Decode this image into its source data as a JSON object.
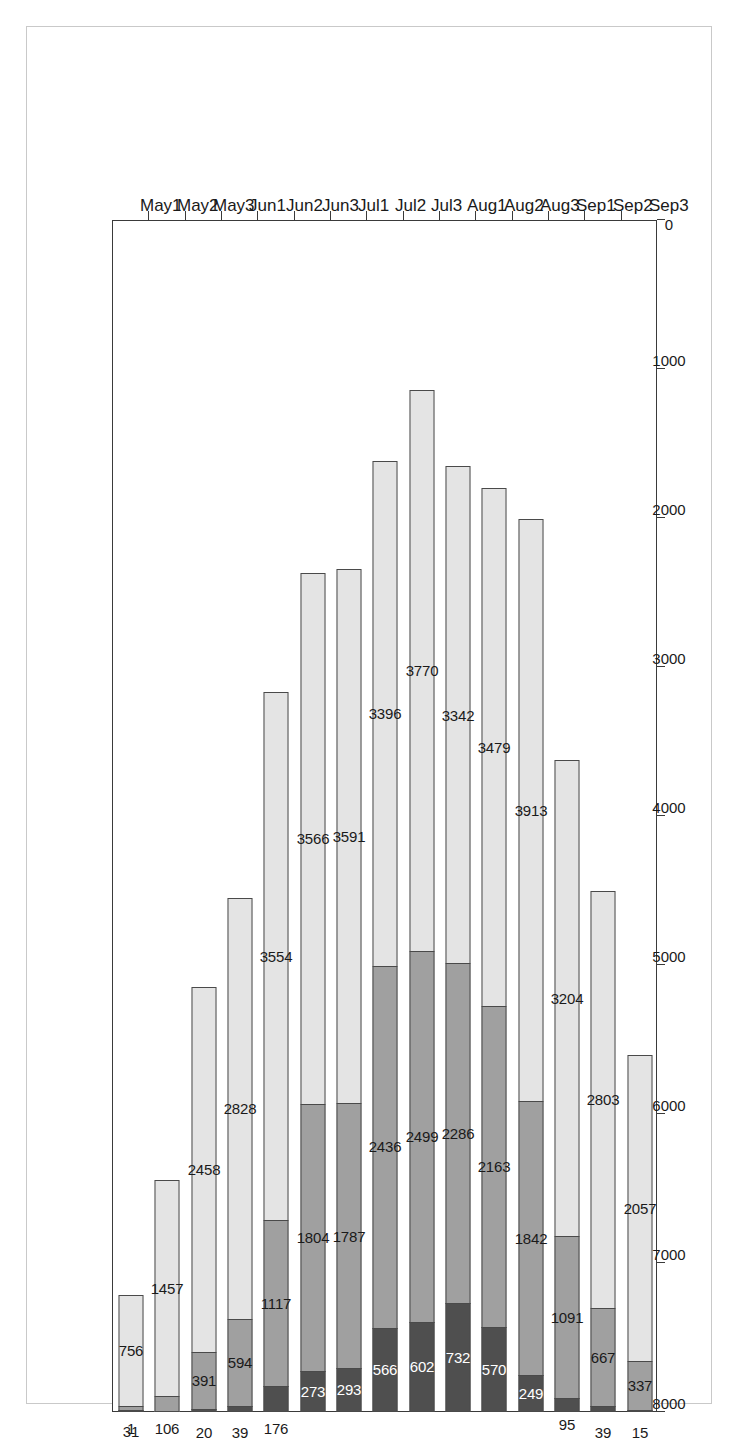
{
  "chart_data": {
    "type": "bar",
    "orientation": "horizontal-stacked",
    "title": "Thessaloniki, Greece",
    "subtitle": "Hours of THI values / category",
    "subtitle2": "Baseline: 1961–90",
    "xlabel": "",
    "ylabel": "",
    "grid": false,
    "legend_position": "top-left",
    "value_axis": {
      "ticks": [
        8000,
        7000,
        6000,
        5000,
        4000,
        3000,
        2000,
        1000,
        0
      ],
      "tick_labels": [
        "8000",
        "7000",
        "6000",
        "5000",
        "4000",
        "3000",
        "2000",
        "1000",
        "0"
      ],
      "min": 0,
      "max": 8000
    },
    "categories": [
      "May1",
      "May2",
      "May3",
      "Jun1",
      "Jun2",
      "Jun3",
      "Jul1",
      "Jul2",
      "Jul3",
      "Aug1",
      "Aug2",
      "Aug3",
      "Sep1",
      "Sep2",
      "Sep3"
    ],
    "series": [
      {
        "name": "84–91",
        "color": "#4f4f4f",
        "values": [
          1,
          0,
          20,
          39,
          176,
          273,
          293,
          566,
          602,
          732,
          570,
          249,
          95,
          39,
          15
        ]
      },
      {
        "name": "80–83",
        "color": "#a0a0a0",
        "values": [
          31,
          106,
          391,
          594,
          1117,
          1804,
          1787,
          2436,
          2499,
          2286,
          2163,
          1842,
          1091,
          667,
          337
        ]
      },
      {
        "name": "75–79",
        "color": "#c4c4c4",
        "values": [
          0,
          0,
          0,
          0,
          0,
          0,
          0,
          0,
          0,
          0,
          0,
          0,
          0,
          0,
          0
        ]
      },
      {
        "name": "69–74",
        "color": "#e4e4e4",
        "values": [
          756,
          1457,
          2458,
          2828,
          3554,
          3566,
          3591,
          3396,
          3770,
          3342,
          3479,
          3913,
          3204,
          2803,
          2057
        ]
      }
    ],
    "legend_entries": [
      "84–91",
      "80–83",
      "75–79",
      "69–74"
    ],
    "legend_colors": [
      "#4f4f4f",
      "#a0a0a0",
      "#c4c4c4",
      "#e4e4e4"
    ],
    "bar_labels": {
      "May1": [
        "1",
        "31",
        "756"
      ],
      "May2": [
        "0",
        "106",
        "1457"
      ],
      "May3": [
        "20",
        "391",
        "2458"
      ],
      "Jun1": [
        "39",
        "594",
        "2828"
      ],
      "Jun2": [
        "176",
        "1117",
        "3554"
      ],
      "Jun3": [
        "273",
        "1804",
        "3566"
      ],
      "Jul1": [
        "293",
        "1787",
        "3591"
      ],
      "Jul2": [
        "566",
        "2436",
        "3396"
      ],
      "Jul3": [
        "602",
        "2499",
        "3770"
      ],
      "Aug1": [
        "732",
        "2286",
        "3342"
      ],
      "Aug2": [
        "570",
        "2163",
        "3479"
      ],
      "Aug3": [
        "249",
        "1842",
        "3913"
      ],
      "Sep1": [
        "95",
        "1091",
        "3204"
      ],
      "Sep2": [
        "39",
        "667",
        "2803"
      ],
      "Sep3": [
        "15",
        "337",
        "2057"
      ]
    }
  }
}
